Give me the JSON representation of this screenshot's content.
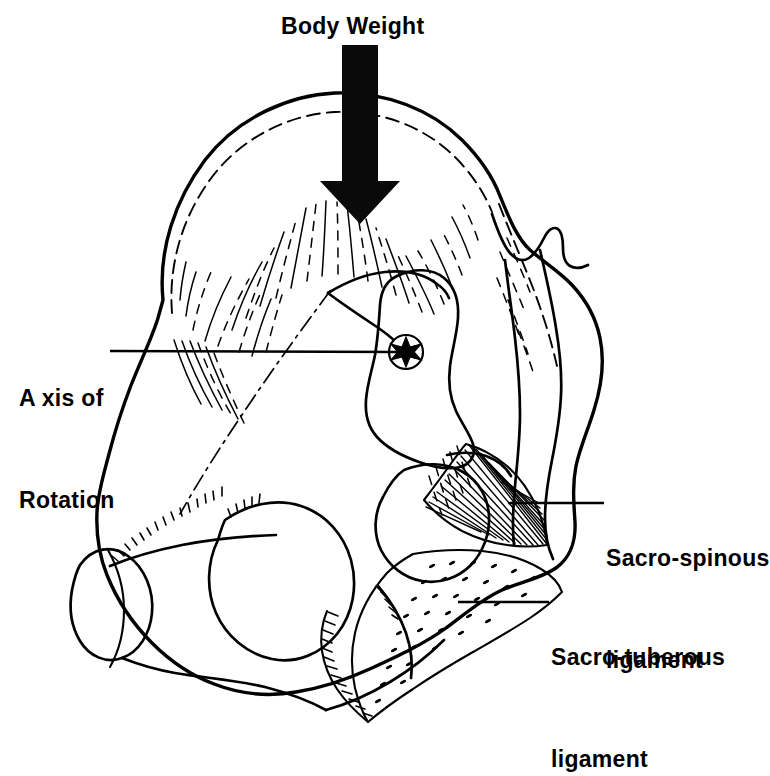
{
  "figure": {
    "background_color": "#ffffff",
    "ink_color": "#000000"
  },
  "labels": {
    "body_weight": "Body Weight",
    "axis_of_rotation_line1": "A xis of",
    "axis_of_rotation_line2": "Rotation",
    "sacrospinous_line1": "Sacro-spinous",
    "sacrospinous_line2": "ligament",
    "sacrotuberous_line1": "Sacro-tuberous",
    "sacrotuberous_line2": "ligament"
  },
  "markers": {
    "axis_marker": "axis-of-rotation-star",
    "force_arrow": "downward-force-arrow"
  },
  "structures": [
    "ilium",
    "iliac-crest",
    "sacrum",
    "sacroiliac-joint",
    "greater-sciatic-notch",
    "acetabulum",
    "obturator-foramen",
    "pubic-symphysis-cut",
    "ischial-tuberosity",
    "sacrospinous-ligament",
    "sacrotuberous-ligament",
    "coccyx"
  ]
}
